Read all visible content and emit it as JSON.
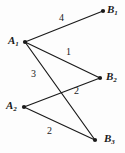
{
  "figure": {
    "type": "bipartite-weighted-graph",
    "background_color": "#fdfdfd",
    "stroke_color": "#1a1a1a",
    "width": 125,
    "height": 153
  },
  "nodes": [
    {
      "id": "A1",
      "base": "A",
      "sub": "1",
      "label": "A₁",
      "side": "left",
      "x": 25,
      "y": 42,
      "label_x": 8,
      "label_y": 35
    },
    {
      "id": "A2",
      "base": "A",
      "sub": "2",
      "label": "A₂",
      "side": "left",
      "x": 24,
      "y": 107,
      "label_x": 6,
      "label_y": 100
    },
    {
      "id": "B1",
      "base": "B",
      "sub": "1",
      "label": "B₁",
      "side": "right",
      "x": 103,
      "y": 11,
      "label_x": 107,
      "label_y": 4
    },
    {
      "id": "B2",
      "base": "B",
      "sub": "2",
      "label": "B₂",
      "side": "right",
      "x": 100,
      "y": 78,
      "label_x": 106,
      "label_y": 71
    },
    {
      "id": "B3",
      "base": "B",
      "sub": "3",
      "label": "B₃",
      "side": "right",
      "x": 95,
      "y": 140,
      "label_x": 104,
      "label_y": 133
    }
  ],
  "edges": [
    {
      "from": "A1",
      "to": "B1",
      "weight": "4",
      "x1": 25,
      "y1": 42,
      "x2": 103,
      "y2": 11,
      "label_x": 59,
      "label_y": 13
    },
    {
      "from": "A1",
      "to": "B2",
      "weight": "1",
      "x1": 25,
      "y1": 42,
      "x2": 100,
      "y2": 78,
      "label_x": 66,
      "label_y": 47
    },
    {
      "from": "A1",
      "to": "B3",
      "weight": "3",
      "x1": 25,
      "y1": 42,
      "x2": 95,
      "y2": 140,
      "label_x": 31,
      "label_y": 69
    },
    {
      "from": "A2",
      "to": "B2",
      "weight": "2",
      "x1": 24,
      "y1": 107,
      "x2": 100,
      "y2": 78,
      "label_x": 74,
      "label_y": 86
    },
    {
      "from": "A2",
      "to": "B3",
      "weight": "2",
      "x1": 24,
      "y1": 107,
      "x2": 95,
      "y2": 140,
      "label_x": 47,
      "label_y": 126
    }
  ]
}
